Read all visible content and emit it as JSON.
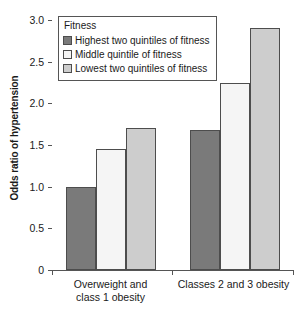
{
  "chart_data": {
    "type": "bar",
    "title": "",
    "xlabel": "",
    "ylabel": "Odds ratio of hypertension",
    "ylim": [
      0,
      3.0
    ],
    "yticks": [
      0,
      0.5,
      1.0,
      1.5,
      2.0,
      2.5,
      3.0
    ],
    "ytick_labels": [
      "0",
      "0.5",
      "1.0",
      "1.5",
      "2.0",
      "2.5",
      "3.0"
    ],
    "grid": false,
    "legend": {
      "title": "Fitness",
      "position": "top-left-inside",
      "entries": [
        "Highest two quintiles of fitness",
        "Middle quintile of fitness",
        "Lowest two quintiles of fitness"
      ]
    },
    "categories": [
      "Overweight and\nclass 1 obesity",
      "Classes 2 and 3 obesity"
    ],
    "series": [
      {
        "name": "Highest two quintiles of fitness",
        "values": [
          1.0,
          1.68
        ],
        "color": "#7a7a7a"
      },
      {
        "name": "Middle quintile of fitness",
        "values": [
          1.45,
          2.25
        ],
        "color": "#f5f5f5"
      },
      {
        "name": "Lowest two quintiles of fitness",
        "values": [
          1.7,
          2.9
        ],
        "color": "#cdcdcd"
      }
    ]
  },
  "colors": {
    "axis": "#555555",
    "bar_outline": "#4d4d4d",
    "text": "#1a1a1a",
    "background": "#ffffff"
  }
}
